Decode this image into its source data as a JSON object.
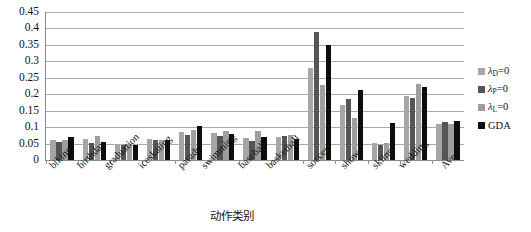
{
  "chart_data": {
    "type": "bar",
    "title": "",
    "xlabel": "动作类别",
    "ylabel": "",
    "ylim": [
      0,
      0.45
    ],
    "grid": true,
    "legend_position": "right",
    "categories": [
      "biking",
      "birthday",
      "graduation",
      "iceskating",
      "parade",
      "swimming",
      "baseball",
      "basketball",
      "soccer",
      "show",
      "skiing",
      "wedding",
      "Ave"
    ],
    "y_ticks": [
      "0",
      "0.05",
      "0.1",
      "0.15",
      "0.2",
      "0.25",
      "0.3",
      "0.35",
      "0.4",
      "0.45"
    ],
    "y_tick_values": [
      0,
      0.05,
      0.1,
      0.15,
      0.2,
      0.25,
      0.3,
      0.35,
      0.4,
      0.45
    ],
    "series": [
      {
        "name": "λ_D=0",
        "label": "λ",
        "subscript": "D",
        "suffix": "=0",
        "color": "#a6a6a6",
        "values": [
          0.06,
          0.063,
          0.047,
          0.063,
          0.085,
          0.081,
          0.066,
          0.07,
          0.28,
          0.168,
          0.052,
          0.196,
          0.108
        ]
      },
      {
        "name": "λ_P=0",
        "label": "λ",
        "subscript": "P",
        "suffix": "=0",
        "color": "#555555",
        "values": [
          0.056,
          0.051,
          0.047,
          0.06,
          0.077,
          0.074,
          0.057,
          0.074,
          0.39,
          0.186,
          0.046,
          0.188,
          0.117
        ]
      },
      {
        "name": "λ_L=0",
        "label": "λ",
        "subscript": "L",
        "suffix": "=0",
        "color": "#9e9e9e",
        "values": [
          0.061,
          0.073,
          0.047,
          0.061,
          0.09,
          0.087,
          0.088,
          0.077,
          0.227,
          0.128,
          0.053,
          0.23,
          0.11
        ]
      },
      {
        "name": "GDA",
        "label": "GDA",
        "subscript": "",
        "suffix": "",
        "color": "#0d0d0d",
        "values": [
          0.071,
          0.056,
          0.046,
          0.061,
          0.103,
          0.078,
          0.071,
          0.064,
          0.349,
          0.212,
          0.112,
          0.221,
          0.12
        ]
      }
    ]
  }
}
